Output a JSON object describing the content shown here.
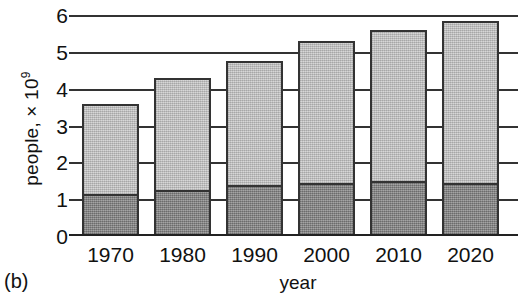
{
  "panel": {
    "tag": "(b)"
  },
  "chart_data": {
    "type": "bar",
    "subtype": "stacked-bar",
    "title": "",
    "xlabel": "year",
    "ylabel": "people, × 10",
    "ylabel_exponent": "9",
    "categories": [
      "1970",
      "1980",
      "1990",
      "2000",
      "2010",
      "2020"
    ],
    "series": [
      {
        "name": "lower-segment",
        "color": "#8a8a8a",
        "values": [
          1.15,
          1.25,
          1.4,
          1.45,
          1.5,
          1.45
        ]
      },
      {
        "name": "upper-segment",
        "color": "#cacaca",
        "values": [
          2.45,
          3.05,
          3.35,
          3.85,
          4.1,
          4.4
        ]
      }
    ],
    "totals": [
      3.6,
      4.3,
      4.75,
      5.3,
      5.6,
      5.85
    ],
    "yticks": [
      0,
      1,
      2,
      3,
      4,
      5,
      6
    ],
    "ytick_labels": [
      "0",
      "1",
      "2",
      "3",
      "4",
      "5",
      "6"
    ],
    "ylim": [
      0,
      6.2
    ],
    "grid": "horizontal-rules-at-ticks",
    "legend": "none"
  }
}
